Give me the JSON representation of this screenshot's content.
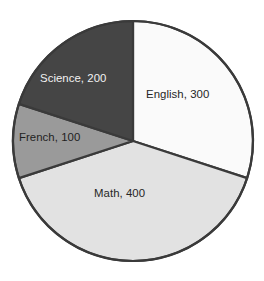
{
  "chart_data": {
    "type": "pie",
    "title": "",
    "subtitle": "",
    "xlabel": "",
    "ylabel": "",
    "legend": "none",
    "grid": false,
    "total": 1000,
    "start_angle_deg": 0,
    "direction": "clockwise",
    "categories": [
      "English",
      "Math",
      "French",
      "Science"
    ],
    "values": [
      300,
      400,
      100,
      200
    ],
    "slices": [
      {
        "name": "English",
        "value": 300,
        "label": "English, 300",
        "percent": 30,
        "angle_deg": 108,
        "start_deg": 0,
        "end_deg": 108,
        "fill": "#fafafa",
        "stroke": "#3a3a3a",
        "text_color": "#262626",
        "label_x": 146,
        "label_y": 98
      },
      {
        "name": "Math",
        "value": 400,
        "label": "Math, 400",
        "percent": 40,
        "angle_deg": 144,
        "start_deg": 108,
        "end_deg": 252,
        "fill": "#e2e2e2",
        "stroke": "#3a3a3a",
        "text_color": "#262626",
        "label_x": 94,
        "label_y": 197
      },
      {
        "name": "French",
        "value": 100,
        "label": "French, 100",
        "percent": 10,
        "angle_deg": 36,
        "start_deg": 252,
        "end_deg": 288,
        "fill": "#9a9a9a",
        "stroke": "#3a3a3a",
        "text_color": "#1f1f1f",
        "label_x": 19,
        "label_y": 141
      },
      {
        "name": "Science",
        "value": 200,
        "label": "Science, 200",
        "percent": 20,
        "angle_deg": 72,
        "start_deg": 288,
        "end_deg": 360,
        "fill": "#454545",
        "stroke": "#3a3a3a",
        "text_color": "#f2f2f2",
        "label_x": 40,
        "label_y": 82
      }
    ],
    "geometry": {
      "center_x": 133,
      "center_y": 141,
      "radius": 120
    },
    "colors": {
      "english": "#fafafa",
      "math": "#e2e2e2",
      "french": "#9a9a9a",
      "science": "#454545",
      "outline": "#3a3a3a",
      "background": "#ffffff"
    }
  }
}
